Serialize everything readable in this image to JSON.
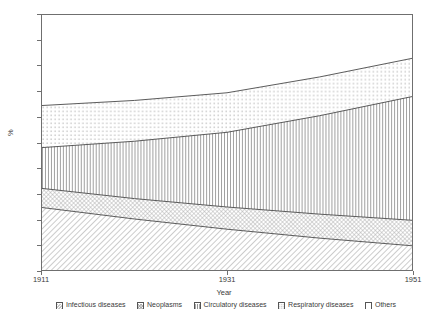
{
  "chart_data": {
    "type": "area",
    "title": "",
    "subtitle": "",
    "xlabel": "Year",
    "ylabel": "%",
    "xlim": [
      1911,
      1951
    ],
    "ylim": [
      0,
      100
    ],
    "grid": false,
    "stacked": true,
    "legend_position": "bottom",
    "x": [
      1911,
      1921,
      1931,
      1941,
      1951
    ],
    "xticks": [
      "1911",
      "1931",
      "1951"
    ],
    "yticks": [
      "0",
      "10",
      "20",
      "30",
      "40",
      "50",
      "60",
      "70",
      "80",
      "90",
      "100"
    ],
    "series": [
      {
        "name": "Infectious diseases",
        "pattern": "diagonal-hatch",
        "values": [
          24.5,
          20.0,
          16.0,
          12.5,
          9.5
        ],
        "cumulative": [
          24.5,
          20.0,
          16.0,
          12.5,
          9.5
        ]
      },
      {
        "name": "Neoplasms",
        "pattern": "cross-hatch",
        "values": [
          7.5,
          8.0,
          8.7,
          9.4,
          10.0
        ],
        "cumulative": [
          32.0,
          28.0,
          24.7,
          21.9,
          19.5
        ]
      },
      {
        "name": "Circulatory diseases",
        "pattern": "vertical-lines",
        "values": [
          16.0,
          22.5,
          29.3,
          38.6,
          48.5
        ],
        "cumulative": [
          48.0,
          50.5,
          54.0,
          60.5,
          68.0
        ]
      },
      {
        "name": "Respiratory diseases",
        "pattern": "dotted",
        "values": [
          16.5,
          16.0,
          15.5,
          15.2,
          15.0
        ],
        "cumulative": [
          64.5,
          66.5,
          69.5,
          75.7,
          83.0
        ]
      },
      {
        "name": "Others",
        "pattern": "blank",
        "values": [
          35.5,
          33.5,
          30.5,
          24.3,
          17.0
        ],
        "cumulative": [
          100,
          100,
          100,
          100,
          100
        ]
      }
    ]
  },
  "axes": {
    "y_title": "%",
    "x_title": "Year",
    "y_tick_labels": [
      "100",
      "90",
      "80",
      "70",
      "60",
      "50",
      "40",
      "30",
      "20",
      "10",
      "0"
    ],
    "x_tick_labels": [
      "1911",
      "1931",
      "1951"
    ]
  },
  "legend": {
    "items": [
      {
        "label": "Infectious diseases"
      },
      {
        "label": "Neoplasms"
      },
      {
        "label": "Circulatory diseases"
      },
      {
        "label": "Respiratory diseases"
      },
      {
        "label": "Others"
      }
    ]
  },
  "colors": {
    "axis": "#6f6f6f",
    "text": "#3a3a3a",
    "line": "#4a4a4a",
    "background": "#ffffff"
  }
}
